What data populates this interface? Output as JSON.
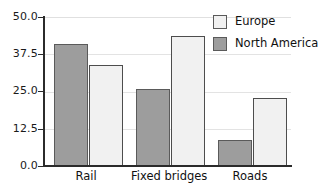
{
  "chart_data": {
    "type": "bar",
    "title": "",
    "subtitle": "",
    "xlabel": "",
    "ylabel": "",
    "categories": [
      "Rail",
      "Fixed bridges",
      "Roads"
    ],
    "series": [
      {
        "name": "Europe",
        "color": "#f1f1f1",
        "values": [
          34.0,
          43.5,
          22.8
        ]
      },
      {
        "name": "North America",
        "color": "#9d9d9d",
        "values": [
          41.0,
          25.8,
          8.7
        ]
      }
    ],
    "series_draw_order": [
      "North America",
      "Europe"
    ],
    "ylim": [
      0.0,
      50.0
    ],
    "yticks": [
      0.0,
      12.5,
      25.0,
      37.5,
      50.0
    ],
    "ytick_labels": [
      "0.0",
      "12.5",
      "25.0",
      "37.5",
      "50.0"
    ],
    "grid": true,
    "grid_axis": "y",
    "grid_color": "#e3e3e3",
    "legend_position": "top-right",
    "legend_frame": false,
    "axis_color": "#2b2b2b",
    "background": "#ffffff"
  },
  "legend": {
    "entries": [
      {
        "label": "Europe",
        "swatch": "legend-swatch-europe"
      },
      {
        "label": "North America",
        "swatch": "legend-swatch-north-america"
      }
    ]
  },
  "axes": {
    "y_labels": [
      "50.0",
      "37.5",
      "25.0",
      "12.5",
      "0.0"
    ],
    "x_labels": [
      "Rail",
      "Fixed bridges",
      "Roads"
    ]
  }
}
